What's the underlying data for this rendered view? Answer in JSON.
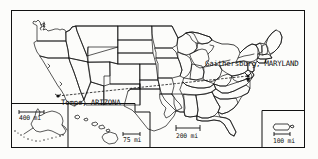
{
  "figure": {
    "name": "united-states-map",
    "type": "map",
    "background_color": "#fcfcfa",
    "line_color": "#111111",
    "frame": {
      "x": 11,
      "y": 10,
      "width": 294,
      "height": 138
    }
  },
  "labels": {
    "gaithersburg": "Gaithersburg, MARYLAND",
    "tempe": "Tempe, ARIZONA"
  },
  "scales": {
    "main": "200 mi",
    "alaska": "400 mi",
    "hawaii": "75 mi",
    "puerto_rico": "100 mi"
  },
  "insets": [
    {
      "name": "alaska-inset",
      "scale": "400 mi"
    },
    {
      "name": "hawaii-inset",
      "scale": "75 mi"
    },
    {
      "name": "puerto-rico-inset",
      "scale": "100 mi"
    }
  ],
  "markers": [
    {
      "name": "tempe-marker",
      "city": "Tempe",
      "state": "ARIZONA",
      "x": 58,
      "y": 96
    },
    {
      "name": "gaithersburg-marker",
      "city": "Gaithersburg",
      "state": "MARYLAND",
      "x": 248,
      "y": 76
    }
  ],
  "connection": {
    "name": "route-line",
    "from": "Tempe, ARIZONA",
    "to": "Gaithersburg, MARYLAND"
  }
}
